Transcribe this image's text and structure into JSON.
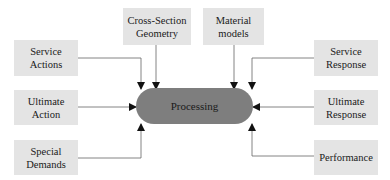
{
  "diagram": {
    "center": {
      "label": "Processing"
    },
    "inputs_left": [
      {
        "line1": "Service",
        "line2": "Actions"
      },
      {
        "line1": "Ultimate",
        "line2": "Action"
      },
      {
        "line1": "Special",
        "line2": "Demands"
      }
    ],
    "inputs_top": [
      {
        "line1": "Cross-Section",
        "line2": "Geometry"
      },
      {
        "line1": "Material",
        "line2": "models"
      }
    ],
    "outputs_right": [
      {
        "line1": "Service",
        "line2": "Response"
      },
      {
        "line1": "Ultimate",
        "line2": "Response"
      },
      {
        "line1": "Performance",
        "line2": ""
      }
    ],
    "colors": {
      "box_fill": "#e4e4e4",
      "pill_fill": "#7e7e7e",
      "line": "#555555"
    }
  }
}
